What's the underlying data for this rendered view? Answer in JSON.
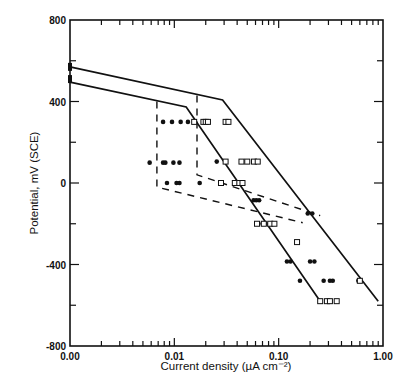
{
  "chart_data": {
    "type": "scatter",
    "title": "",
    "xlabel": "Current density (µA cm⁻²)",
    "ylabel": "Potential, mV (SCE)",
    "xscale": "log",
    "xlim": [
      0.001,
      1.0
    ],
    "ylim": [
      -800,
      800
    ],
    "x_tick_labels": [
      "0.00",
      "0.01",
      "0.10",
      "1.00"
    ],
    "x_tick_values": [
      0.001,
      0.01,
      0.1,
      1.0
    ],
    "y_tick_labels": [
      "800",
      "400",
      "0",
      "-400",
      "-800"
    ],
    "y_tick_values": [
      800,
      400,
      0,
      -400,
      -800
    ],
    "grid": false,
    "legend": null,
    "series": [
      {
        "name": "upper solid boundary",
        "style": "solid-line",
        "x": [
          0.001,
          0.029,
          0.9
        ],
        "y": [
          570,
          408,
          -580
        ]
      },
      {
        "name": "lower solid boundary",
        "style": "solid-line",
        "x": [
          0.001,
          0.013,
          0.25
        ],
        "y": [
          495,
          373,
          -580
        ]
      },
      {
        "name": "dashed boundary A",
        "style": "dashed-line",
        "x": [
          0.0068,
          0.0068,
          0.17
        ],
        "y": [
          400,
          -20,
          -195
        ]
      },
      {
        "name": "dashed boundary B",
        "style": "dashed-line",
        "x": [
          0.0165,
          0.0165,
          0.25
        ],
        "y": [
          430,
          40,
          -160
        ]
      },
      {
        "name": "filled circles",
        "style": "filled-circle",
        "x": [
          0.0078,
          0.0095,
          0.0115,
          0.0135,
          0.0058,
          0.0078,
          0.0082,
          0.0098,
          0.0112,
          0.0085,
          0.0105,
          0.0112,
          0.0175,
          0.0255,
          0.0575,
          0.061,
          0.065,
          0.07,
          0.075,
          0.19,
          0.21,
          0.2,
          0.22,
          0.12,
          0.13,
          0.16,
          0.27,
          0.31,
          0.33,
          0.58
        ],
        "y": [
          300,
          300,
          300,
          300,
          100,
          100,
          100,
          100,
          100,
          0,
          0,
          0,
          0,
          105,
          -85,
          -85,
          -85,
          -200,
          -200,
          -150,
          -150,
          -385,
          -385,
          -385,
          -385,
          -480,
          -480,
          -480,
          -480,
          -480
        ]
      },
      {
        "name": "open squares",
        "style": "open-square",
        "x": [
          0.0155,
          0.019,
          0.02,
          0.021,
          0.031,
          0.033,
          0.031,
          0.044,
          0.05,
          0.058,
          0.063,
          0.038,
          0.042,
          0.045,
          0.028,
          0.062,
          0.072,
          0.083,
          0.091,
          0.15,
          0.25,
          0.29,
          0.31,
          0.36,
          0.6
        ],
        "y": [
          300,
          300,
          300,
          300,
          300,
          300,
          105,
          105,
          105,
          105,
          105,
          0,
          0,
          0,
          0,
          -200,
          -200,
          -200,
          -200,
          -290,
          -580,
          -580,
          -580,
          -580,
          -480
        ]
      }
    ]
  }
}
